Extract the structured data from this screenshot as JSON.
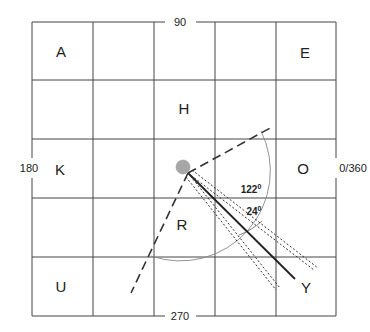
{
  "diagram": {
    "type": "compass-grid",
    "grid": {
      "rows": 5,
      "cols": 5
    },
    "axis_labels": {
      "top": "90",
      "bottom": "270",
      "left": "180",
      "right": "0/360"
    },
    "cell_labels": [
      {
        "label": "A",
        "row": 0,
        "col": 0
      },
      {
        "label": "E",
        "row": 0,
        "col": 4
      },
      {
        "label": "H",
        "row": 1,
        "col": 2
      },
      {
        "label": "K",
        "row": 2,
        "col": 0
      },
      {
        "label": "O",
        "row": 2,
        "col": 4
      },
      {
        "label": "R",
        "row": 3,
        "col": 2
      },
      {
        "label": "U",
        "row": 4,
        "col": 0
      },
      {
        "label": "Y",
        "row": 4,
        "col": 4
      }
    ],
    "angles": {
      "wide": {
        "value": "122",
        "unit": "0"
      },
      "narrow": {
        "value": "24",
        "unit": "0"
      }
    },
    "center_point_color": "#a6a6a6",
    "line_color": "#222222",
    "arc_color": "#888888"
  }
}
